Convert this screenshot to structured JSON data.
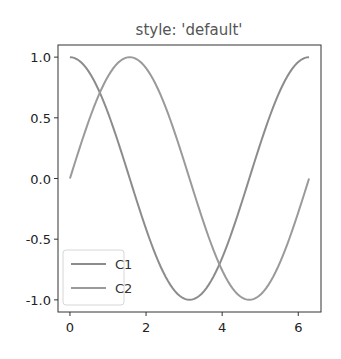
{
  "chart_data": {
    "type": "line",
    "title": "style: 'default'",
    "xlabel": "",
    "ylabel": "",
    "xlim": [
      -0.314,
      6.597
    ],
    "ylim": [
      -1.1,
      1.1
    ],
    "x_ticks": [
      0,
      2,
      4,
      6
    ],
    "x_tick_labels": [
      "0",
      "2",
      "4",
      "6"
    ],
    "y_ticks": [
      1.0,
      0.5,
      0.0,
      -0.5,
      -1.0
    ],
    "y_tick_labels": [
      "1.0",
      "0.5",
      "0.0",
      "-0.5",
      "-1.0"
    ],
    "grid": false,
    "legend_position": "lower left",
    "series": [
      {
        "name": "C1",
        "function": "cos(x)",
        "color": "#8c8c8c",
        "x": [
          0,
          0.785,
          1.571,
          2.356,
          3.142,
          3.927,
          4.712,
          5.498,
          6.283
        ],
        "values": [
          1.0,
          0.707,
          0.0,
          -0.707,
          -1.0,
          -0.707,
          0.0,
          0.707,
          1.0
        ]
      },
      {
        "name": "C2",
        "function": "sin(x)",
        "color": "#9a9a9a",
        "x": [
          0,
          0.785,
          1.571,
          2.356,
          3.142,
          3.927,
          4.712,
          5.498,
          6.283
        ],
        "values": [
          0.0,
          0.707,
          1.0,
          0.707,
          0.0,
          -0.707,
          -1.0,
          -0.707,
          0.0
        ]
      }
    ]
  },
  "legend": {
    "items": [
      {
        "label": "C1"
      },
      {
        "label": "C2"
      }
    ]
  }
}
